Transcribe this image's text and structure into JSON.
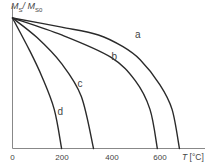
{
  "chart_data": {
    "type": "line",
    "title": "",
    "ylabel": "M_S / M_S0",
    "ylabel_main": "M",
    "ylabel_sub1": "S",
    "ylabel_sep": "/ M",
    "ylabel_sub2": "S0",
    "xlabel": "T [°C]",
    "xlabel_var": "T",
    "xlabel_unit": " [°C]",
    "xlim": [
      0,
      700
    ],
    "ylim": [
      0,
      1.0
    ],
    "xticks": [
      "0",
      "200",
      "400",
      "600"
    ],
    "xtick_values": [
      0,
      200,
      400,
      600
    ],
    "grid": false,
    "legend": "none (curves labeled inline)",
    "series": [
      {
        "name": "a",
        "x": [
          0,
          200,
          350,
          450,
          520,
          600,
          650,
          680
        ],
        "y": [
          1.0,
          0.93,
          0.87,
          0.78,
          0.68,
          0.49,
          0.3,
          0.0
        ]
      },
      {
        "name": "b",
        "x": [
          0,
          200,
          400,
          500,
          560,
          590
        ],
        "y": [
          1.0,
          0.87,
          0.7,
          0.52,
          0.3,
          0.0
        ]
      },
      {
        "name": "c",
        "x": [
          0,
          100,
          200,
          280,
          330
        ],
        "y": [
          1.0,
          0.85,
          0.65,
          0.4,
          0.0
        ]
      },
      {
        "name": "d",
        "x": [
          0,
          70,
          120,
          170,
          200
        ],
        "y": [
          1.0,
          0.75,
          0.55,
          0.3,
          0.0
        ]
      }
    ],
    "labels": [
      {
        "text": "a",
        "x": 510,
        "y": 0.88
      },
      {
        "text": "b",
        "x": 415,
        "y": 0.71
      },
      {
        "text": "c",
        "x": 275,
        "y": 0.5
      },
      {
        "text": "d",
        "x": 195,
        "y": 0.29
      }
    ]
  }
}
